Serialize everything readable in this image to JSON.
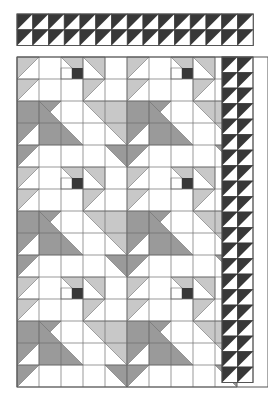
{
  "figure": {
    "title": "Pieced quilt layout diagram",
    "canvas": {
      "width": 268,
      "height": 399,
      "background": "#ffffff"
    }
  },
  "palette": {
    "background": "#ffffff",
    "white_patch": "#ffffff",
    "light_gray_patch": "#c8c8c8",
    "medium_gray_patch": "#9a9a9a",
    "dark_patch": "#383838",
    "grid_line": "#6e6e6e",
    "outline": "#555555"
  },
  "top_border": {
    "name": "sawtooth-border-strip",
    "x": 17,
    "y": 14,
    "cell": 15.75,
    "columns": 15,
    "rows": 2,
    "unit": "half-square-triangle",
    "dark_color": "#383838",
    "light_color": "#ffffff",
    "orientation": "dark-upper-left"
  },
  "main_panel": {
    "name": "quilt-field",
    "x": 17,
    "y": 57,
    "cell": 22,
    "columns": 10,
    "rows": 15,
    "grid_visible": true,
    "block_repeat": {
      "columns": 2,
      "rows": 3,
      "unit_cells_x": 5,
      "unit_cells_y": 5
    }
  },
  "right_border": {
    "name": "sawtooth-border-right",
    "x": 222,
    "y": 57,
    "cell": 15.5,
    "columns": 2,
    "rows": 21,
    "unit": "half-square-triangle",
    "dark_color": "#383838",
    "light_color": "#ffffff",
    "orientation": "dark-upper-left"
  },
  "patches": {
    "legend": [
      {
        "key": "white",
        "label": "Background / white patch",
        "color": "#ffffff"
      },
      {
        "key": "light",
        "label": "Light gray patch",
        "color": "#c8c8c8"
      },
      {
        "key": "medium",
        "label": "Medium gray patch",
        "color": "#9a9a9a"
      },
      {
        "key": "dark",
        "label": "Dark accent square",
        "color": "#383838"
      }
    ]
  },
  "block_units": {
    "comment": "One 5x5-cell repeating block. Coordinates are in cell units from the block origin. tri = right triangle given by three points; rect = filled rectangle.",
    "shapes": [
      {
        "kind": "tri",
        "fill": "light",
        "points": [
          [
            0,
            0
          ],
          [
            1,
            0
          ],
          [
            0,
            1
          ]
        ]
      },
      {
        "kind": "tri",
        "fill": "light",
        "points": [
          [
            0,
            1
          ],
          [
            1,
            1
          ],
          [
            0,
            2
          ]
        ]
      },
      {
        "kind": "tri",
        "fill": "medium",
        "points": [
          [
            0,
            2
          ],
          [
            2,
            2
          ],
          [
            0,
            4
          ]
        ]
      },
      {
        "kind": "tri",
        "fill": "medium",
        "points": [
          [
            0,
            4
          ],
          [
            1,
            4
          ],
          [
            0,
            5
          ]
        ]
      },
      {
        "kind": "tri",
        "fill": "medium",
        "points": [
          [
            1,
            2
          ],
          [
            3,
            4
          ],
          [
            1,
            4
          ]
        ]
      },
      {
        "kind": "tri",
        "fill": "light",
        "points": [
          [
            2,
            0
          ],
          [
            3,
            0
          ],
          [
            3,
            1
          ]
        ]
      },
      {
        "kind": "tri",
        "fill": "light",
        "points": [
          [
            3,
            0
          ],
          [
            4,
            0
          ],
          [
            4,
            1
          ]
        ]
      },
      {
        "kind": "rect",
        "fill": "dark",
        "rect": [
          2.5,
          0.5,
          0.5,
          0.5
        ]
      },
      {
        "kind": "tri",
        "fill": "light",
        "points": [
          [
            3,
            1
          ],
          [
            4,
            1
          ],
          [
            3,
            2
          ]
        ]
      },
      {
        "kind": "tri",
        "fill": "light",
        "points": [
          [
            3,
            2
          ],
          [
            5,
            2
          ],
          [
            5,
            4
          ]
        ]
      },
      {
        "kind": "tri",
        "fill": "medium",
        "points": [
          [
            4,
            4
          ],
          [
            5,
            4
          ],
          [
            5,
            5
          ]
        ]
      }
    ]
  },
  "accessibility": {
    "alt": "Black-and-white quilt pattern diagram with sawtooth borders and repeating triangle blocks."
  }
}
